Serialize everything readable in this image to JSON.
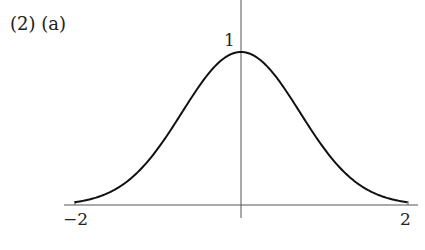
{
  "problem_label": "(2)  (a)",
  "chart_data": {
    "type": "line",
    "title": "",
    "function": "y = e^(-x^2)",
    "xlabel": "",
    "ylabel": "",
    "xlim": [
      -2,
      2
    ],
    "ylim": [
      0,
      1
    ],
    "x_tick_labels": [
      "−2",
      "2"
    ],
    "y_tick_labels": [
      "1"
    ],
    "grid": false,
    "legend": null,
    "series": [
      {
        "name": "curve",
        "x": [
          -2,
          -1.5,
          -1,
          -0.5,
          0,
          0.5,
          1,
          1.5,
          2
        ],
        "y": [
          0.018,
          0.105,
          0.368,
          0.779,
          1.0,
          0.779,
          0.368,
          0.105,
          0.018
        ]
      }
    ]
  },
  "colors": {
    "curve": "#111111",
    "axes": "#555555"
  }
}
